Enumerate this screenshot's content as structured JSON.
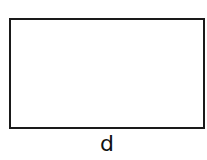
{
  "diagram": {
    "shape": "rectangle",
    "stroke_color": "#1a1a1a",
    "fill_color": "#ffffff",
    "bottom_label": "d"
  }
}
